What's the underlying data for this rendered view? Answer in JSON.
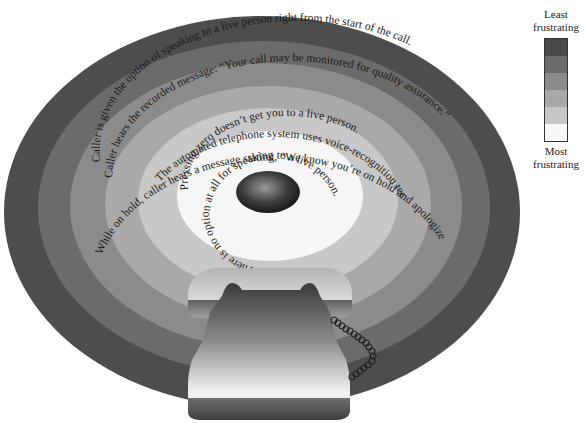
{
  "legend": {
    "top_label": "Least frustrating",
    "top_label_line1": "Least",
    "top_label_line2": "frustrating",
    "bottom_label_line1": "Most",
    "bottom_label_line2": "frustrating",
    "colors": [
      "#4a4a4a",
      "#6a6a6a",
      "#8a8a8a",
      "#a8a8a8",
      "#c6c6c6",
      "#f7f7f7"
    ]
  },
  "rings": [
    {
      "level": 1,
      "color": "#4d4d4d",
      "text": "Caller is given the option of speaking to a live person right from the start of the call."
    },
    {
      "level": 2,
      "color": "#6b6b6b",
      "text": "Caller hears the recorded message: “Your call may be monitored for quality assurance.”"
    },
    {
      "level": 3,
      "color": "#8b8b8b",
      "text": "While on hold, caller hears a message stating, “We know you’re on hold and apologize for the inconvenience.”"
    },
    {
      "level": 4,
      "color": "#a9a9a9",
      "text": "The automated telephone system uses voice-recognition technology."
    },
    {
      "level": 5,
      "color": "#c8c8c8",
      "text": "Pressing zero doesn’t get you to a live person."
    },
    {
      "level": 6,
      "color": "#f6f6f6",
      "text": "There is no option at all for speaking to a live person."
    }
  ],
  "center": {
    "label": "telephone-earpiece-hole"
  },
  "illustration": {
    "object": "rotary telephone with coiled cord"
  }
}
